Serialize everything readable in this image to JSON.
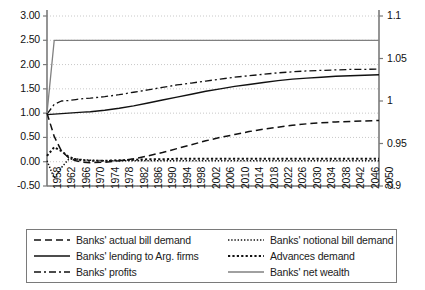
{
  "chart_data": {
    "type": "line",
    "title": "",
    "xlabel": "",
    "ylabel": "",
    "y2label": "",
    "grid": true,
    "legend_position": "bottom",
    "xlim": [
      1958,
      2050
    ],
    "ylim": [
      -0.5,
      3.0
    ],
    "y2lim": [
      0.9,
      1.1
    ],
    "x_tick_labels": [
      "1958",
      "1962",
      "1966",
      "1970",
      "1974",
      "1978",
      "1982",
      "1986",
      "1990",
      "1994",
      "1998",
      "2002",
      "2006",
      "2010",
      "2014",
      "2018",
      "2022",
      "2026",
      "2030",
      "2034",
      "2038",
      "2042",
      "2046",
      "2050"
    ],
    "y_tick_labels": [
      "3.00",
      "2.50",
      "2.00",
      "1.50",
      "1.00",
      "0.50",
      "0.00",
      "-0.50"
    ],
    "y_tick_values": [
      3.0,
      2.5,
      2.0,
      1.5,
      1.0,
      0.5,
      0.0,
      -0.5
    ],
    "y2_tick_labels": [
      "1.1",
      "1.05",
      "1",
      "0.95",
      "0.9"
    ],
    "y2_tick_values": [
      1.1,
      1.05,
      1.0,
      0.95,
      0.9
    ],
    "x": [
      1958,
      1960,
      1962,
      1964,
      1966,
      1968,
      1970,
      1974,
      1978,
      1982,
      1986,
      1990,
      1994,
      1998,
      2002,
      2006,
      2010,
      2014,
      2018,
      2022,
      2026,
      2030,
      2034,
      2038,
      2042,
      2046,
      2050
    ],
    "series": [
      {
        "name": "Banks' actual bill demand",
        "axis": "left",
        "style": "dashed",
        "color": "#111111",
        "values": [
          1.0,
          0.52,
          0.22,
          0.08,
          0.02,
          -0.01,
          -0.02,
          -0.01,
          0.02,
          0.06,
          0.12,
          0.19,
          0.27,
          0.35,
          0.43,
          0.5,
          0.56,
          0.62,
          0.67,
          0.71,
          0.75,
          0.78,
          0.8,
          0.82,
          0.83,
          0.84,
          0.85
        ]
      },
      {
        "name": "Banks' notional bill demand",
        "axis": "left",
        "style": "dotted-fine",
        "color": "#111111",
        "values": [
          0.02,
          -0.34,
          -0.12,
          0.05,
          0.06,
          0.04,
          0.03,
          0.02,
          0.02,
          0.02,
          0.02,
          0.02,
          0.02,
          0.02,
          0.02,
          0.02,
          0.02,
          0.02,
          0.02,
          0.02,
          0.02,
          0.02,
          0.02,
          0.02,
          0.02,
          0.02,
          0.02
        ]
      },
      {
        "name": "Banks' lending to Arg. firms",
        "axis": "left",
        "style": "solid",
        "color": "#111111",
        "values": [
          0.97,
          0.98,
          0.99,
          1.0,
          1.01,
          1.02,
          1.03,
          1.06,
          1.1,
          1.15,
          1.21,
          1.27,
          1.33,
          1.39,
          1.45,
          1.5,
          1.55,
          1.59,
          1.63,
          1.67,
          1.7,
          1.72,
          1.74,
          1.76,
          1.77,
          1.78,
          1.79
        ]
      },
      {
        "name": "Advances demand",
        "axis": "left",
        "style": "dotted-bold",
        "color": "#111111",
        "values": [
          0.12,
          0.3,
          0.22,
          0.1,
          0.05,
          0.03,
          0.02,
          0.02,
          0.03,
          0.04,
          0.05,
          0.05,
          0.06,
          0.06,
          0.06,
          0.06,
          0.06,
          0.06,
          0.06,
          0.06,
          0.06,
          0.06,
          0.06,
          0.06,
          0.06,
          0.06,
          0.06
        ]
      },
      {
        "name": "Banks' profits",
        "axis": "left",
        "style": "dash-dot",
        "color": "#111111",
        "values": [
          0.98,
          1.18,
          1.25,
          1.26,
          1.28,
          1.3,
          1.31,
          1.34,
          1.38,
          1.43,
          1.48,
          1.53,
          1.58,
          1.62,
          1.66,
          1.7,
          1.74,
          1.77,
          1.8,
          1.83,
          1.85,
          1.87,
          1.88,
          1.89,
          1.9,
          1.9,
          1.91
        ]
      },
      {
        "name": "Banks' net wealth",
        "axis": "left",
        "style": "solid-gray",
        "color": "#808080",
        "values": [
          1.0,
          2.5,
          2.5,
          2.5,
          2.5,
          2.5,
          2.5,
          2.5,
          2.5,
          2.5,
          2.5,
          2.5,
          2.5,
          2.5,
          2.5,
          2.5,
          2.5,
          2.5,
          2.5,
          2.5,
          2.5,
          2.5,
          2.5,
          2.5,
          2.5,
          2.5,
          2.5
        ]
      }
    ]
  },
  "legend": {
    "items": [
      {
        "label": "Banks' actual bill demand",
        "style": "dashed",
        "column": 1
      },
      {
        "label": "Banks' lending to Arg. firms",
        "style": "solid",
        "column": 1
      },
      {
        "label": "Banks' profits",
        "style": "dash-dot",
        "column": 1
      },
      {
        "label": "Banks' notional bill demand",
        "style": "dotted-fine",
        "column": 2
      },
      {
        "label": "Advances demand",
        "style": "dotted-bold",
        "column": 2
      },
      {
        "label": "Banks' net wealth",
        "style": "solid-gray",
        "column": 2
      }
    ]
  },
  "colors": {
    "axis": "#7a7a7a",
    "grid": "#c8c8c8",
    "line": "#111111",
    "gray_line": "#808080",
    "background": "#ffffff"
  }
}
